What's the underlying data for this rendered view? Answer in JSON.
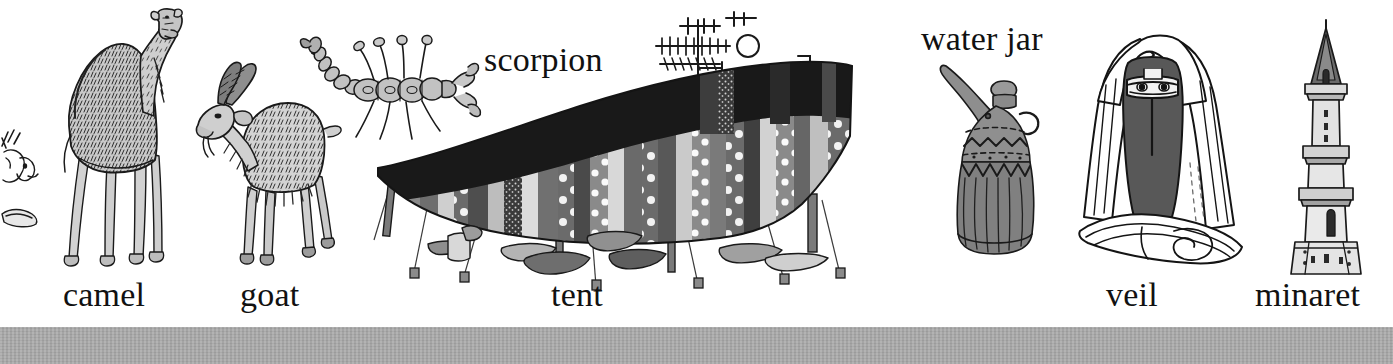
{
  "page": {
    "background_color": "#ffffff",
    "width": 1393,
    "height": 364,
    "ink_color": "#1a1a1a"
  },
  "bottom_bar": {
    "name": "page-edge-bar",
    "color": "#a8a8a8"
  },
  "labels": [
    {
      "id": "camel",
      "text": "camel",
      "x": 63,
      "y": 278,
      "size": 34
    },
    {
      "id": "goat",
      "text": "goat",
      "x": 240,
      "y": 278,
      "size": 34
    },
    {
      "id": "scorpion",
      "text": "scorpion",
      "x": 484,
      "y": 43,
      "size": 34
    },
    {
      "id": "tent",
      "text": "tent",
      "x": 551,
      "y": 278,
      "size": 34
    },
    {
      "id": "waterjar",
      "text": "water jar",
      "x": 921,
      "y": 22,
      "size": 34
    },
    {
      "id": "veil",
      "text": "veil",
      "x": 1106,
      "y": 278,
      "size": 34
    },
    {
      "id": "minaret",
      "text": "minaret",
      "x": 1255,
      "y": 278,
      "size": 34
    }
  ],
  "illustrations": [
    {
      "id": "partial-animal-head",
      "name": "animal-head-illustration",
      "x": 0,
      "y": 130,
      "w": 40,
      "h": 110
    },
    {
      "id": "camel",
      "name": "camel-illustration",
      "x": 55,
      "y": 8,
      "w": 125,
      "h": 260
    },
    {
      "id": "goat",
      "name": "goat-illustration",
      "x": 196,
      "y": 45,
      "w": 140,
      "h": 220
    },
    {
      "id": "scorpion",
      "name": "scorpion-illustration",
      "x": 298,
      "y": 25,
      "w": 175,
      "h": 115
    },
    {
      "id": "antenna",
      "name": "tv-antenna-illustration",
      "x": 690,
      "y": 12,
      "w": 135,
      "h": 70
    },
    {
      "id": "tent",
      "name": "tent-illustration",
      "x": 370,
      "y": 70,
      "w": 480,
      "h": 200
    },
    {
      "id": "waterjar",
      "name": "water-jar-illustration",
      "x": 938,
      "y": 62,
      "w": 105,
      "h": 195
    },
    {
      "id": "veil",
      "name": "veil-figure-illustration",
      "x": 1078,
      "y": 25,
      "w": 165,
      "h": 250
    },
    {
      "id": "minaret",
      "name": "minaret-illustration",
      "x": 1283,
      "y": 18,
      "w": 80,
      "h": 255
    }
  ],
  "tent_detail": {
    "roof_color": "#1c1c1c",
    "panel_colors": [
      "#6e6e6e",
      "#d8d8d8",
      "#3a3a3a",
      "#909090",
      "#bdbdbd",
      "#515151"
    ],
    "dot_color": "#ffffff",
    "peg_count": 5,
    "ground_items": 7
  },
  "palette": {
    "ink": "#1a1a1a",
    "light_gray": "#d6d6d6",
    "mid_gray": "#9a9a9a",
    "dark_gray": "#555555",
    "near_black": "#1c1c1c",
    "bar_gray": "#a8a8a8"
  }
}
